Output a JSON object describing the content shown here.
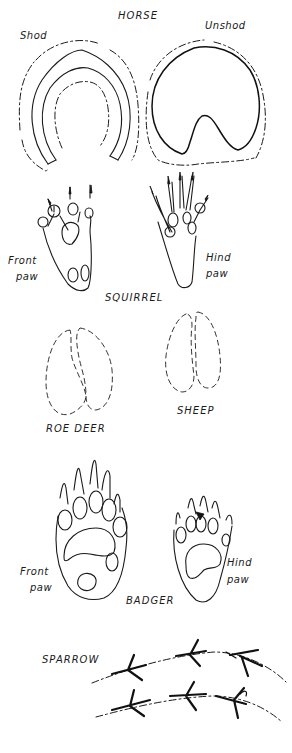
{
  "diagram": {
    "sections": [
      {
        "id": "horse",
        "heading": "HORSE",
        "tracks": [
          {
            "id": "horse-shod",
            "label": "Shod"
          },
          {
            "id": "horse-unshod",
            "label": "Unshod"
          }
        ]
      },
      {
        "id": "squirrel",
        "heading": "SQUIRREL",
        "tracks": [
          {
            "id": "squirrel-front",
            "label_line1": "Front",
            "label_line2": "paw"
          },
          {
            "id": "squirrel-hind",
            "label_line1": "Hind",
            "label_line2": "paw"
          }
        ]
      },
      {
        "id": "roe-deer",
        "heading": "ROE DEER"
      },
      {
        "id": "sheep",
        "heading": "SHEEP"
      },
      {
        "id": "badger",
        "heading": "BADGER",
        "tracks": [
          {
            "id": "badger-front",
            "label_line1": "Front",
            "label_line2": "paw"
          },
          {
            "id": "badger-hind",
            "label_line1": "Hind",
            "label_line2": "paw"
          }
        ]
      },
      {
        "id": "sparrow",
        "heading": "SPARROW"
      }
    ],
    "colors": {
      "ink": "#1a1a1a",
      "background": "#ffffff"
    }
  }
}
